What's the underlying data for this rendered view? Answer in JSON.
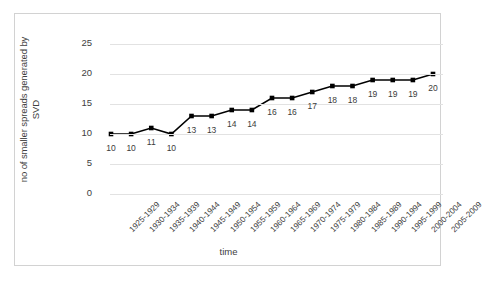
{
  "chart_data": {
    "type": "line",
    "title": "",
    "xlabel": "time",
    "ylabel": "no of smaller spreads generated by SVD",
    "ylabel_lines": [
      "no of smaller spreads generated by",
      "SVD"
    ],
    "categories": [
      "1925-1929",
      "1930-1934",
      "1935-1939",
      "1940-1944",
      "1945-1949",
      "1950-1954",
      "1955-1959",
      "1960-1964",
      "1965-1969",
      "1970-1974",
      "1975-1979",
      "1980-1984",
      "1985-1989",
      "1990-1994",
      "1995-1999",
      "2000-2004",
      "2005-2009"
    ],
    "values": [
      10,
      10,
      11,
      10,
      13,
      13,
      14,
      14,
      16,
      16,
      17,
      18,
      18,
      19,
      19,
      19,
      20
    ],
    "data_labels": [
      "10",
      "10",
      "11",
      "10",
      "13",
      "13",
      "14",
      "14",
      "16",
      "16",
      "17",
      "18",
      "18",
      "19",
      "19",
      "19",
      "20"
    ],
    "yticks": [
      "0",
      "5",
      "10",
      "15",
      "20",
      "25"
    ],
    "ytick_values": [
      0,
      5,
      10,
      15,
      20,
      25
    ],
    "ylim": [
      0,
      25
    ],
    "grid": true,
    "legend": false,
    "legend_position": "none",
    "series_color": "#000000",
    "marker": "square",
    "gridline_color": "#e2e2e2",
    "frame_color": "#d2d2d2"
  }
}
